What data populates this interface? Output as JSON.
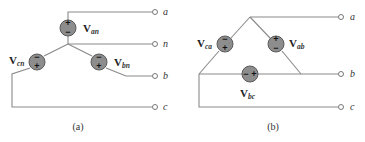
{
  "panel_a": {
    "caption": "(a)",
    "configuration": "wye",
    "sources": [
      {
        "label": "V",
        "sub": "an",
        "top_sign": "+",
        "bottom_sign": "−"
      },
      {
        "label": "V",
        "sub": "bn",
        "top_sign": "−",
        "bottom_sign": "+"
      },
      {
        "label": "V",
        "sub": "cn",
        "top_sign": "−",
        "bottom_sign": "+"
      }
    ],
    "terminals": [
      "a",
      "n",
      "b",
      "c"
    ]
  },
  "panel_b": {
    "caption": "(b)",
    "configuration": "delta",
    "sources": [
      {
        "label": "V",
        "sub": "ca",
        "top_sign": "−",
        "bottom_sign": "+"
      },
      {
        "label": "V",
        "sub": "ab",
        "top_sign": "+",
        "bottom_sign": "−"
      },
      {
        "label": "V",
        "sub": "bc",
        "left_sign": "−",
        "right_sign": "+"
      }
    ],
    "terminals": [
      "a",
      "b",
      "c"
    ]
  },
  "colors": {
    "wire": "#8a8a8a",
    "source_fill": "#8d8d8d"
  }
}
